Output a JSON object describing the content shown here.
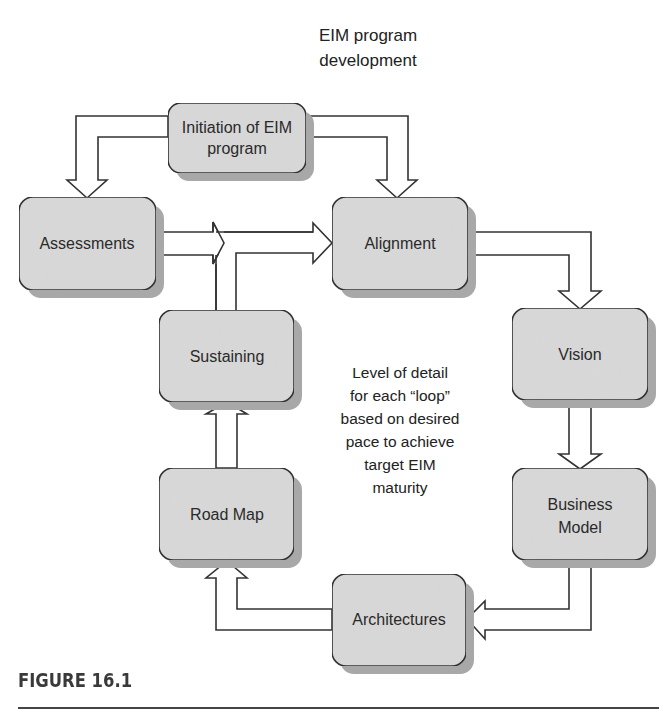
{
  "title": {
    "lines": [
      "EIM program",
      "development"
    ]
  },
  "nodes": {
    "initiation": {
      "lines": [
        "Initiation of EIM",
        "program"
      ]
    },
    "assessments": {
      "lines": [
        "Assessments"
      ]
    },
    "alignment": {
      "lines": [
        "Alignment"
      ]
    },
    "vision": {
      "lines": [
        "Vision"
      ]
    },
    "business_model": {
      "lines": [
        "Business",
        "Model"
      ]
    },
    "architectures": {
      "lines": [
        "Architectures"
      ]
    },
    "road_map": {
      "lines": [
        "Road Map"
      ]
    },
    "sustaining": {
      "lines": [
        "Sustaining"
      ]
    }
  },
  "note": {
    "lines": [
      "Level of detail",
      "for each “loop”",
      "based on desired",
      "pace to achieve",
      "target EIM",
      "maturity"
    ]
  },
  "caption": "FIGURE 16.1",
  "colors": {
    "box_fill": "#d9d9d9",
    "box_shadow": "#a8a8a8",
    "stroke": "#333333"
  }
}
